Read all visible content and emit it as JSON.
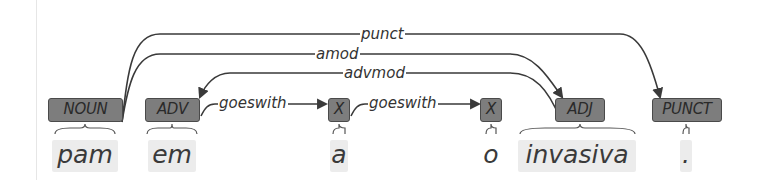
{
  "diagram": {
    "type": "dependency-parse",
    "tokens": [
      {
        "word": "pam",
        "pos": "NOUN"
      },
      {
        "word": "em",
        "pos": "ADV"
      },
      {
        "word": "a",
        "pos": "X"
      },
      {
        "word": "o",
        "pos": "X"
      },
      {
        "word": "invasiva",
        "pos": "ADJ"
      },
      {
        "word": ".",
        "pos": "PUNCT"
      }
    ],
    "arcs": [
      {
        "label": "punct",
        "head": "NOUN",
        "dependent": "PUNCT"
      },
      {
        "label": "amod",
        "head": "NOUN",
        "dependent": "ADJ"
      },
      {
        "label": "advmod",
        "head": "ADJ",
        "dependent": "ADV"
      },
      {
        "label": "goeswith",
        "head": "ADV",
        "dependent": "X (a)"
      },
      {
        "label": "goeswith",
        "head": "X (a)",
        "dependent": "X (o)"
      }
    ],
    "colors": {
      "tag_fill": "#7d7d7d",
      "tag_border": "#4a4a4a",
      "arc_stroke": "#3a3a3a",
      "word_bg": "#ececec"
    }
  }
}
